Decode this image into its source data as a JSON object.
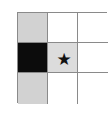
{
  "grid": {
    "rows": 3,
    "cols": 3,
    "cells": [
      {
        "row": 1,
        "col": 1,
        "fill": "gray",
        "color": "#d2d2d2",
        "symbol": ""
      },
      {
        "row": 1,
        "col": 2,
        "fill": "white",
        "color": "#ffffff",
        "symbol": ""
      },
      {
        "row": 1,
        "col": 3,
        "fill": "white",
        "color": "#ffffff",
        "symbol": ""
      },
      {
        "row": 2,
        "col": 1,
        "fill": "black",
        "color": "#0c0c0c",
        "symbol": ""
      },
      {
        "row": 2,
        "col": 2,
        "fill": "light-gray",
        "color": "#dcdcdc",
        "symbol": "★"
      },
      {
        "row": 2,
        "col": 3,
        "fill": "white",
        "color": "#ffffff",
        "symbol": ""
      },
      {
        "row": 3,
        "col": 1,
        "fill": "gray",
        "color": "#d2d2d2",
        "symbol": ""
      },
      {
        "row": 3,
        "col": 2,
        "fill": "white",
        "color": "#ffffff",
        "symbol": ""
      },
      {
        "row": 3,
        "col": 3,
        "fill": "white",
        "color": "#ffffff",
        "symbol": ""
      }
    ]
  },
  "icons": {
    "star": "star-icon"
  }
}
